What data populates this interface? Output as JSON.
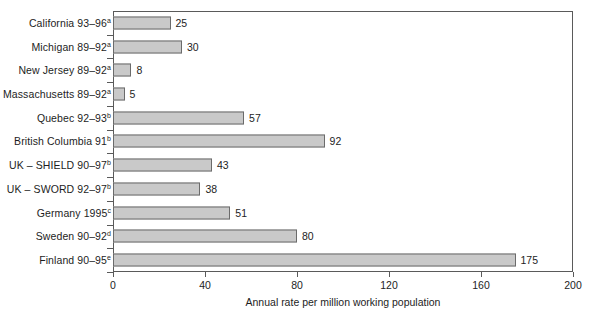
{
  "chart_data": {
    "type": "bar",
    "orientation": "horizontal",
    "title": "",
    "xlabel": "Annual rate per million working population",
    "ylabel": "",
    "xlim": [
      0,
      200
    ],
    "xticks": [
      0,
      40,
      80,
      120,
      160,
      200
    ],
    "xtick_labels": [
      "0",
      "40",
      "80",
      "120",
      "160",
      "200"
    ],
    "grid": false,
    "legend": false,
    "bar_color": "#c9c9c9",
    "bar_border_color": "#6b6b6b",
    "axis_color": "#5a5a5a",
    "categories": [
      "California 93–96a",
      "Michigan 89–92a",
      "New Jersey 89–92a",
      "Massachusetts 89–92a",
      "Quebec 92–93b",
      "British Columbia 91b",
      "UK – SHIELD 90–97b",
      "UK – SWORD 92–97b",
      "Germany 1995c",
      "Sweden 90–92d",
      "Finland 90–95e"
    ],
    "values": [
      25,
      30,
      8,
      5,
      57,
      92,
      43,
      38,
      51,
      80,
      175
    ],
    "bars": [
      {
        "name": "California 93–96",
        "superscript": "a",
        "value": 25,
        "value_label": "25"
      },
      {
        "name": "Michigan 89–92",
        "superscript": "a",
        "value": 30,
        "value_label": "30"
      },
      {
        "name": "New Jersey 89–92",
        "superscript": "a",
        "value": 8,
        "value_label": "8"
      },
      {
        "name": "Massachusetts 89–92",
        "superscript": "a",
        "value": 5,
        "value_label": "5"
      },
      {
        "name": "Quebec 92–93",
        "superscript": "b",
        "value": 57,
        "value_label": "57"
      },
      {
        "name": "British Columbia 91",
        "superscript": "b",
        "value": 92,
        "value_label": "92"
      },
      {
        "name": "UK – SHIELD 90–97",
        "superscript": "b",
        "value": 43,
        "value_label": "43"
      },
      {
        "name": "UK – SWORD 92–97",
        "superscript": "b",
        "value": 38,
        "value_label": "38"
      },
      {
        "name": "Germany 1995",
        "superscript": "c",
        "value": 51,
        "value_label": "51"
      },
      {
        "name": "Sweden 90–92",
        "superscript": "d",
        "value": 80,
        "value_label": "80"
      },
      {
        "name": "Finland 90–95",
        "superscript": "e",
        "value": 175,
        "value_label": "175"
      }
    ]
  }
}
